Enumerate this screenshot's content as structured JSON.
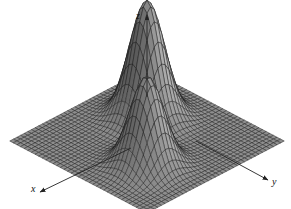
{
  "figure": {
    "title": "",
    "background_color": "#ffffff",
    "width": 291,
    "height": 209
  },
  "axes": {
    "x": {
      "label": "x",
      "arrow": {
        "from": [
          131,
          148
        ],
        "to": [
          40,
          192
        ]
      },
      "label_pos": [
        31,
        184
      ]
    },
    "y": {
      "label": "y",
      "arrow": {
        "from": [
          196,
          141
        ],
        "to": [
          268,
          180
        ]
      },
      "label_pos": [
        272,
        177
      ]
    },
    "z": {
      "label": "z",
      "arrow": {
        "from": [
          147,
          97
        ],
        "to": [
          147,
          15
        ]
      },
      "label_pos": [
        136,
        11
      ]
    }
  },
  "style": {
    "surface_fill": "#8c8c8c",
    "surface_fill_dark": "#5a5a5a",
    "surface_fill_light": "#b4b4b4",
    "mesh_line_color": "#1a1a1a",
    "axis_color": "#222222",
    "label_color": "#111111",
    "mesh_line_width": 0.45
  },
  "chart_data": {
    "type": "surface",
    "title": "",
    "xlabel": "x",
    "ylabel": "y",
    "zlabel": "z",
    "grid": true,
    "legend": "none",
    "projection": {
      "type": "oblique",
      "origin_px": [
        147,
        141
      ],
      "x_axis_px": [
        -1.04,
        0.545
      ],
      "y_axis_px": [
        1.04,
        0.545
      ],
      "z_axis_px": [
        0,
        -1.0
      ],
      "z_scale_px": 118
    },
    "domain": {
      "u_range": [
        -3.0,
        3.0
      ],
      "v_range": [
        -3.0,
        3.0
      ],
      "u_steps": 38,
      "v_steps": 38
    },
    "zlim": [
      0,
      1.0
    ],
    "surface_function": "z(u,v) = 1.00*exp(-((u+0.95)^2 + (v+0.95)^2)/0.62) + 0.76*exp(-((u-1.05)^2 + (v-1.05)^2)/0.60)",
    "peaks": [
      {
        "name": "peak-left",
        "center_uv": [
          -0.95,
          -0.95
        ],
        "height": 1.0,
        "spread": 0.62,
        "apex_px": [
          111,
          24
        ]
      },
      {
        "name": "peak-right",
        "center_uv": [
          1.05,
          1.05
        ],
        "height": 0.76,
        "spread": 0.6,
        "apex_px": [
          167,
          45
        ]
      }
    ],
    "base_plane_corners_px": [
      [
        14,
        141
      ],
      [
        145,
        210
      ],
      [
        278,
        138
      ],
      [
        147,
        70
      ]
    ]
  }
}
